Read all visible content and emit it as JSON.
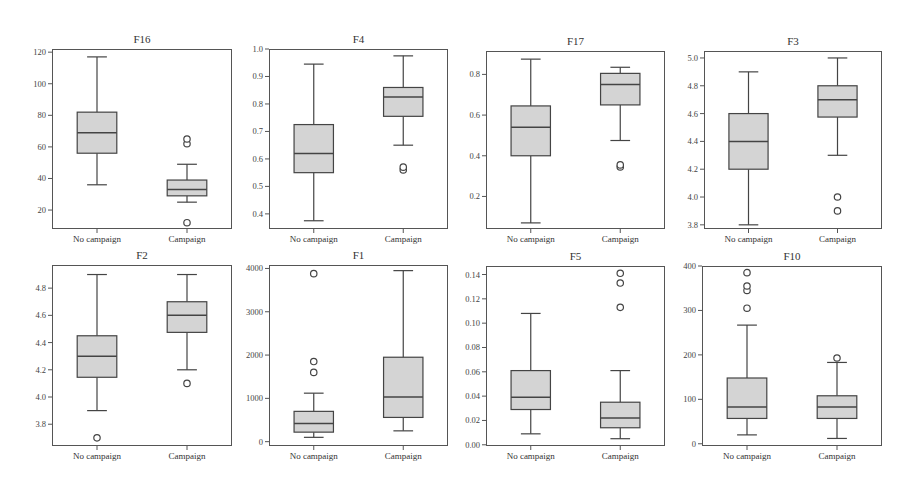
{
  "chart_data": [
    {
      "type": "box",
      "title": "F16",
      "categories": [
        "No campaign",
        "Campaign"
      ],
      "ylim": [
        8,
        122
      ],
      "yticks": [
        20,
        40,
        60,
        80,
        100,
        120
      ],
      "series": [
        {
          "name": "No campaign",
          "whisker_low": 36,
          "q1": 56,
          "median": 69,
          "q3": 82,
          "whisker_high": 117,
          "outliers": []
        },
        {
          "name": "Campaign",
          "whisker_low": 25,
          "q1": 29,
          "median": 33,
          "q3": 39,
          "whisker_high": 49,
          "outliers": [
            12,
            62,
            65
          ]
        }
      ]
    },
    {
      "type": "box",
      "title": "F4",
      "categories": [
        "No campaign",
        "Campaign"
      ],
      "ylim": [
        0.345,
        1.0
      ],
      "yticks": [
        0.4,
        0.5,
        0.6,
        0.7,
        0.8,
        0.9,
        1.0
      ],
      "series": [
        {
          "name": "No campaign",
          "whisker_low": 0.375,
          "q1": 0.55,
          "median": 0.62,
          "q3": 0.725,
          "whisker_high": 0.945,
          "outliers": []
        },
        {
          "name": "Campaign",
          "whisker_low": 0.65,
          "q1": 0.755,
          "median": 0.825,
          "q3": 0.86,
          "whisker_high": 0.975,
          "outliers": [
            0.56,
            0.57
          ]
        }
      ]
    },
    {
      "type": "box",
      "title": "F17",
      "categories": [
        "No campaign",
        "Campaign"
      ],
      "ylim": [
        0.04,
        0.915
      ],
      "yticks": [
        0.2,
        0.4,
        0.6,
        0.8
      ],
      "series": [
        {
          "name": "No campaign",
          "whisker_low": 0.07,
          "q1": 0.4,
          "median": 0.54,
          "q3": 0.645,
          "whisker_high": 0.875,
          "outliers": []
        },
        {
          "name": "Campaign",
          "whisker_low": 0.475,
          "q1": 0.65,
          "median": 0.75,
          "q3": 0.805,
          "whisker_high": 0.835,
          "outliers": [
            0.345,
            0.355
          ]
        }
      ]
    },
    {
      "type": "box",
      "title": "F3",
      "categories": [
        "No campaign",
        "Campaign"
      ],
      "ylim": [
        3.77,
        5.05
      ],
      "yticks": [
        3.8,
        4.0,
        4.2,
        4.4,
        4.6,
        4.8,
        5.0
      ],
      "series": [
        {
          "name": "No campaign",
          "whisker_low": 3.8,
          "q1": 4.2,
          "median": 4.4,
          "q3": 4.6,
          "whisker_high": 4.9,
          "outliers": []
        },
        {
          "name": "Campaign",
          "whisker_low": 4.3,
          "q1": 4.575,
          "median": 4.7,
          "q3": 4.8,
          "whisker_high": 5.0,
          "outliers": [
            3.9,
            4.0
          ]
        }
      ]
    },
    {
      "type": "box",
      "title": "F2",
      "categories": [
        "No campaign",
        "Campaign"
      ],
      "ylim": [
        3.64,
        4.97
      ],
      "yticks": [
        3.8,
        4.0,
        4.2,
        4.4,
        4.6,
        4.8
      ],
      "series": [
        {
          "name": "No campaign",
          "whisker_low": 3.9,
          "q1": 4.145,
          "median": 4.3,
          "q3": 4.45,
          "whisker_high": 4.9,
          "outliers": [
            3.7
          ]
        },
        {
          "name": "Campaign",
          "whisker_low": 4.2,
          "q1": 4.475,
          "median": 4.6,
          "q3": 4.7,
          "whisker_high": 4.9,
          "outliers": [
            4.1
          ]
        }
      ]
    },
    {
      "type": "box",
      "title": "F1",
      "categories": [
        "No campaign",
        "Campaign"
      ],
      "ylim": [
        -100,
        4080
      ],
      "yticks": [
        0,
        1000,
        2000,
        3000,
        4000
      ],
      "series": [
        {
          "name": "No campaign",
          "whisker_low": 100,
          "q1": 220,
          "median": 420,
          "q3": 700,
          "whisker_high": 1120,
          "outliers": [
            1600,
            1850,
            3880
          ]
        },
        {
          "name": "Campaign",
          "whisker_low": 250,
          "q1": 560,
          "median": 1030,
          "q3": 1950,
          "whisker_high": 3950,
          "outliers": []
        }
      ]
    },
    {
      "type": "box",
      "title": "F5",
      "categories": [
        "No campaign",
        "Campaign"
      ],
      "ylim": [
        -0.001,
        0.147
      ],
      "yticks": [
        0.0,
        0.02,
        0.04,
        0.06,
        0.08,
        0.1,
        0.12,
        0.14
      ],
      "series": [
        {
          "name": "No campaign",
          "whisker_low": 0.009,
          "q1": 0.029,
          "median": 0.039,
          "q3": 0.061,
          "whisker_high": 0.108,
          "outliers": []
        },
        {
          "name": "Campaign",
          "whisker_low": 0.005,
          "q1": 0.014,
          "median": 0.022,
          "q3": 0.035,
          "whisker_high": 0.061,
          "outliers": [
            0.113,
            0.133,
            0.141
          ]
        }
      ]
    },
    {
      "type": "box",
      "title": "F10",
      "categories": [
        "No campaign",
        "Campaign"
      ],
      "ylim": [
        -5,
        400
      ],
      "yticks": [
        0,
        100,
        200,
        300,
        400
      ],
      "series": [
        {
          "name": "No campaign",
          "whisker_low": 20,
          "q1": 57,
          "median": 83,
          "q3": 148,
          "whisker_high": 267,
          "outliers": [
            305,
            345,
            355,
            385
          ]
        },
        {
          "name": "Campaign",
          "whisker_low": 12,
          "q1": 57,
          "median": 83,
          "q3": 108,
          "whisker_high": 183,
          "outliers": [
            193
          ]
        }
      ]
    }
  ],
  "panels": [
    {
      "title": "F16",
      "ticklabels": [
        "20",
        "40",
        "60",
        "80",
        "100",
        "120"
      ],
      "xlabels": [
        "No campaign",
        "Campaign"
      ]
    },
    {
      "title": "F4",
      "ticklabels": [
        "0.4",
        "0.5",
        "0.6",
        "0.7",
        "0.8",
        "0.9",
        "1.0"
      ],
      "xlabels": [
        "No campaign",
        "Campaign"
      ]
    },
    {
      "title": "F17",
      "ticklabels": [
        "0.2",
        "0.4",
        "0.6",
        "0.8"
      ],
      "xlabels": [
        "No campaign",
        "Campaign"
      ]
    },
    {
      "title": "F3",
      "ticklabels": [
        "3.8",
        "4.0",
        "4.2",
        "4.4",
        "4.6",
        "4.8",
        "5.0"
      ],
      "xlabels": [
        "No campaign",
        "Campaign"
      ]
    },
    {
      "title": "F2",
      "ticklabels": [
        "3.8",
        "4.0",
        "4.2",
        "4.4",
        "4.6",
        "4.8"
      ],
      "xlabels": [
        "No campaign",
        "Campaign"
      ]
    },
    {
      "title": "F1",
      "ticklabels": [
        "0",
        "1000",
        "2000",
        "3000",
        "4000"
      ],
      "xlabels": [
        "No campaign",
        "Campaign"
      ]
    },
    {
      "title": "F5",
      "ticklabels": [
        "0.00",
        "0.02",
        "0.04",
        "0.06",
        "0.08",
        "0.10",
        "0.12",
        "0.14"
      ],
      "xlabels": [
        "No campaign",
        "Campaign"
      ]
    },
    {
      "title": "F10",
      "ticklabels": [
        "0",
        "100",
        "200",
        "300",
        "400"
      ],
      "xlabels": [
        "No campaign",
        "Campaign"
      ]
    }
  ],
  "colors": {
    "box_fill": "#d4d4d4",
    "line": "#444444",
    "axis": "#555555"
  }
}
